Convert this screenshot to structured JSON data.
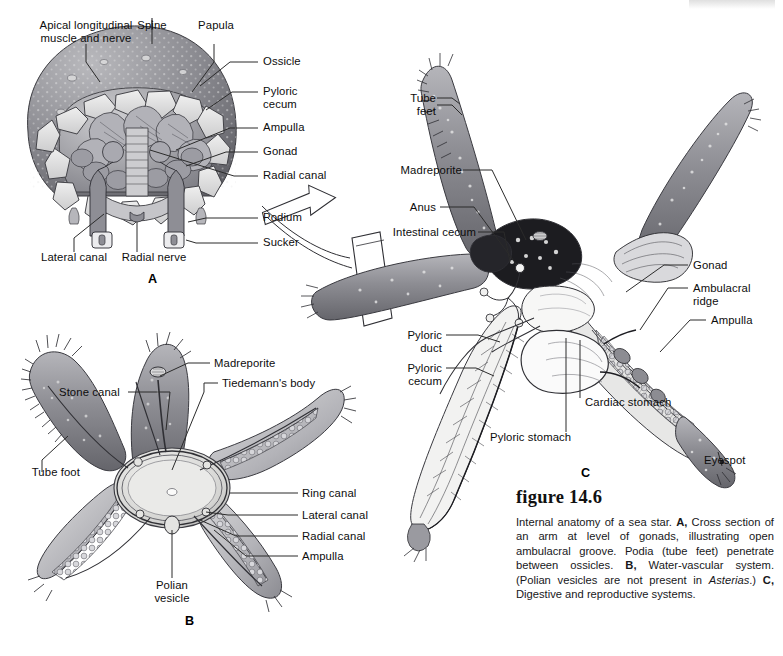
{
  "figure": {
    "number": "figure 14.6",
    "caption_html": "Internal anatomy of a sea star. <b>A,</b> Cross section of an arm at level of gonads, illustrating open ambulacral groove. Podia (tube feet) penetrate between ossicles. <b>B,</b> Water-vascular system. (Polian vesicles are not present in <i>Asterias</i>.) <b>C,</b> Digestive and reproductive systems.",
    "caption_plain": "Internal anatomy of a sea star. A, Cross section of an arm at level of gonads, illustrating open ambulacral groove. Podia (tube feet) penetrate between ossicles. B, Water-vascular system. (Polian vesicles are not present in Asterias.) C, Digestive and reproductive systems."
  },
  "colors": {
    "ink": "#0d0d0d",
    "leader": "#2b2b2b",
    "body_dark": "#7b7b80",
    "body_mid": "#9a9aa0",
    "body_light": "#c9c9cd",
    "highlight": "#ececed",
    "shadow": "#55555a",
    "page": "#ffffff"
  },
  "panels": {
    "a": {
      "letter": "A",
      "title": "Cross section of arm",
      "labels": [
        {
          "id": "apical-longitudinal-muscle-and-nerve",
          "text": "Apical longitudinal\nmuscle and nerve"
        },
        {
          "id": "spine",
          "text": "Spine"
        },
        {
          "id": "papula",
          "text": "Papula"
        },
        {
          "id": "ossicle",
          "text": "Ossicle"
        },
        {
          "id": "pyloric-cecum",
          "text": "Pyloric\ncecum"
        },
        {
          "id": "ampulla",
          "text": "Ampulla"
        },
        {
          "id": "gonad",
          "text": "Gonad"
        },
        {
          "id": "radial-canal",
          "text": "Radial canal"
        },
        {
          "id": "podium",
          "text": "Podium"
        },
        {
          "id": "sucker",
          "text": "Sucker"
        },
        {
          "id": "lateral-canal",
          "text": "Lateral canal"
        },
        {
          "id": "radial-nerve",
          "text": "Radial nerve"
        }
      ]
    },
    "b": {
      "letter": "B",
      "title": "Water-vascular system",
      "labels": [
        {
          "id": "stone-canal",
          "text": "Stone canal"
        },
        {
          "id": "madreporite",
          "text": "Madreporite"
        },
        {
          "id": "tiedemanns-body",
          "text": "Tiedemann's body"
        },
        {
          "id": "tube-foot",
          "text": "Tube foot"
        },
        {
          "id": "ring-canal",
          "text": "Ring canal"
        },
        {
          "id": "lateral-canal",
          "text": "Lateral canal"
        },
        {
          "id": "radial-canal",
          "text": "Radial canal"
        },
        {
          "id": "ampulla",
          "text": "Ampulla"
        },
        {
          "id": "polian-vesicle",
          "text": "Polian\nvesicle"
        }
      ]
    },
    "c": {
      "letter": "C",
      "title": "Digestive and reproductive systems",
      "labels": [
        {
          "id": "tube-feet",
          "text": "Tube\nfeet"
        },
        {
          "id": "madreporite",
          "text": "Madreporite"
        },
        {
          "id": "anus",
          "text": "Anus"
        },
        {
          "id": "intestinal-cecum",
          "text": "Intestinal cecum"
        },
        {
          "id": "gonad",
          "text": "Gonad"
        },
        {
          "id": "ambulacral-ridge",
          "text": "Ambulacral\nridge"
        },
        {
          "id": "ampulla",
          "text": "Ampulla"
        },
        {
          "id": "pyloric-duct",
          "text": "Pyloric\nduct"
        },
        {
          "id": "pyloric-cecum",
          "text": "Pyloric\ncecum"
        },
        {
          "id": "cardiac-stomach",
          "text": "Cardiac stomach"
        },
        {
          "id": "pyloric-stomach",
          "text": "Pyloric stomach"
        },
        {
          "id": "eyespot",
          "text": "Eyespot"
        }
      ]
    }
  }
}
